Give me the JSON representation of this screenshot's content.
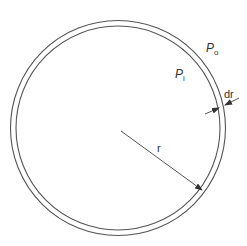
{
  "diagram": {
    "colors": {
      "stroke": "#555555",
      "text": "#333333",
      "background": "#ffffff"
    },
    "labels": {
      "outer_pressure": "P",
      "outer_pressure_sub": "o",
      "inner_pressure": "P",
      "inner_pressure_sub": "i",
      "wall_thickness": "dr",
      "radius": "r"
    }
  }
}
